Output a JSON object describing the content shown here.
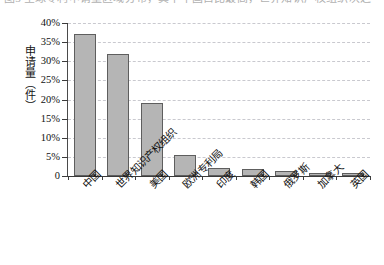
{
  "caption": {
    "text": "图3 全球专利申请量区域分布，其中中国占比最高，世界知识产权组织次之"
  },
  "chart_data": {
    "type": "bar",
    "title": "",
    "xlabel": "",
    "ylabel": "申请量（件）",
    "categories": [
      "中国",
      "世界知识产权组织",
      "美国",
      "欧洲专利局",
      "印度",
      "韩国",
      "俄罗斯",
      "加拿大",
      "英国"
    ],
    "values": [
      37,
      32,
      19,
      5.5,
      2,
      1.8,
      1.3,
      0.8,
      0.8
    ],
    "value_labels": [
      "37%",
      "32%",
      "19%",
      "5.5%",
      "2%",
      "1.8%",
      "1.3%",
      "0.8%",
      "0.8%"
    ],
    "ylim": [
      0,
      40
    ],
    "ytick_values": [
      0,
      5,
      10,
      15,
      20,
      25,
      30,
      35,
      40
    ],
    "ytick_labels": [
      "0",
      "5%",
      "10%",
      "15%",
      "20%",
      "25%",
      "30%",
      "35%",
      "40%"
    ],
    "grid": true,
    "grid_axis": "y",
    "legend": false,
    "bar_fill_color": "#b5b5b5",
    "bar_border_color": "#5e5e5e",
    "gridline_color": "#c9c9cf",
    "axis_color": "#3a3a3a",
    "xtick_label_rotation": -45
  }
}
